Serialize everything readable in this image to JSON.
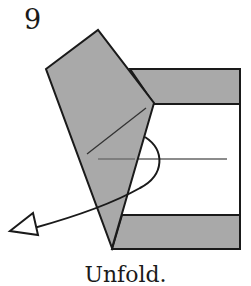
{
  "diagram": {
    "step_number": "9",
    "caption": "Unfold.",
    "colors": {
      "paper_colored": "#a9a9a9",
      "paper_white": "#ffffff",
      "outline": "#1a1a1a",
      "crease": "#555555"
    }
  }
}
